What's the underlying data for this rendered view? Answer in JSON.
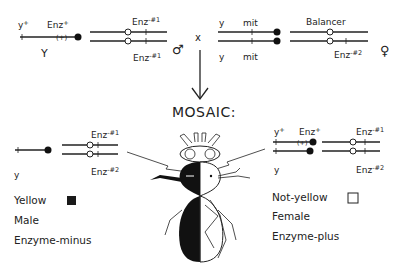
{
  "cross": {
    "male": {
      "sex_chrom": {
        "label_left": "y",
        "label_left_sup": "+",
        "label_right": "Enz",
        "label_right_sup": "+",
        "marker": "(+)",
        "y_label": "Y"
      },
      "autosome_top_label": "Enz",
      "autosome_top_sup": "-#1",
      "autosome_bottom_label": "Enz",
      "autosome_bottom_sup": "-#1",
      "symbol": "♂"
    },
    "cross_symbol": "x",
    "female": {
      "sex_chrom_top": {
        "label_left": "y",
        "label_right": "mit"
      },
      "sex_chrom_bottom": {
        "label_left": "y",
        "label_right": "mit"
      },
      "autosome_top_label": "Balancer",
      "autosome_bottom_label": "Enz",
      "autosome_bottom_sup": "-#2",
      "symbol": "♀"
    }
  },
  "mosaic_title": "MOSAIC:",
  "left_clone": {
    "autosome_top_label": "Enz",
    "autosome_top_sup": "-#1",
    "sex_label": "y",
    "autosome_bottom_label": "Enz",
    "autosome_bottom_sup": "-#2",
    "legend": {
      "line1": "Yellow",
      "line2": "Male",
      "line3": "Enzyme-minus",
      "swatch": "#1a1a1a"
    }
  },
  "right_clone": {
    "sex_top_label": "y",
    "sex_top_sup": "+",
    "enz_label": "Enz",
    "enz_sup": "+",
    "marker": "(+)",
    "autosome_top_label": "Enz",
    "autosome_top_sup": "-#1",
    "sex_bottom_label": "y",
    "autosome_bottom_label": "Enz",
    "autosome_bottom_sup": "-#2",
    "legend": {
      "line1": "Not-yellow",
      "line2": "Female",
      "line3": "Enzyme-plus",
      "swatch": "#ffffff"
    }
  }
}
